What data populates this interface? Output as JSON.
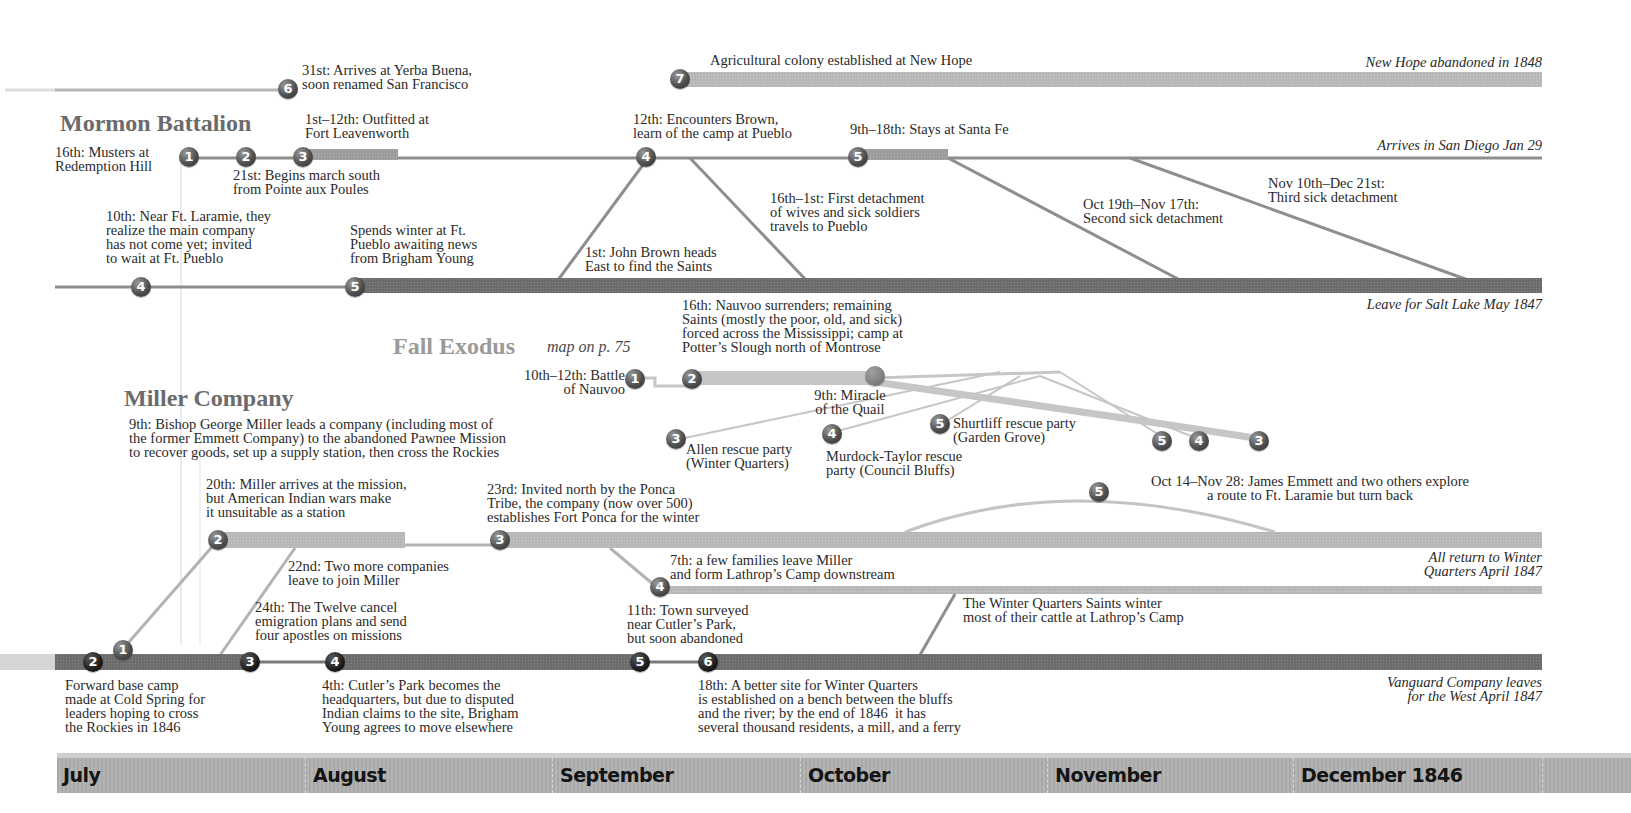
{
  "colors": {
    "battalion_line": "#8a8a8a",
    "battalion_bar": "#9a9a9a",
    "pueblo_bar": "#7c7c7c",
    "new_hope_bar": "#b8b8b8",
    "fall_exodus_line": "#c4c4c4",
    "miller_bar": "#b3b3b3",
    "winter_quarters_bar": "#6e6e6e",
    "month_bar": "#adadad",
    "title_dark": "#6b6b6b",
    "title_light": "#9a9a9a"
  },
  "sections": {
    "mormon_battalion": {
      "title": "Mormon Battalion",
      "events": [
        {
          "n": "1",
          "text": "16th: Musters at\nRedemption Hill"
        },
        {
          "n": "2",
          "text": "21st: Begins march south\nfrom Pointe aux Poules"
        },
        {
          "n": "3",
          "text": "1st–12th: Outfitted at\nFort Leavenworth"
        },
        {
          "n": "4",
          "text": "12th: Encounters Brown,\nlearn of the camp at Pueblo"
        },
        {
          "n": "5",
          "text": "9th–18th: Stays at Santa Fe"
        },
        {
          "n": "6",
          "text": "31st: Arrives at Yerba Buena,\nsoon renamed San Francisco"
        },
        {
          "n": "7",
          "text": "Agricultural colony established at New Hope"
        }
      ],
      "end_labels": {
        "new_hope": "New Hope abandoned in 1848",
        "san_diego": "Arrives in San Diego Jan 29"
      },
      "detachments": [
        {
          "text": "16th–1st: First detachment\nof wives and sick soldiers\ntravels to Pueblo"
        },
        {
          "text": "Oct 19th–Nov 17th:\nSecond sick detachment"
        },
        {
          "text": "Nov 10th–Dec 21st:\nThird sick detachment"
        }
      ]
    },
    "pueblo": {
      "events": [
        {
          "n": "4",
          "text": "10th: Near Ft. Laramie, they\nrealize the main company\nhas not come yet; invited\nto wait at Ft. Pueblo"
        },
        {
          "n": "5",
          "text": "Spends winter at Ft.\nPueblo awaiting news\nfrom Brigham Young"
        }
      ],
      "brown_note": "1st: John Brown heads\nEast to find the Saints",
      "end_label": "Leave for Salt Lake May 1847"
    },
    "fall_exodus": {
      "title": "Fall Exodus",
      "map_ref": "map on p. 75",
      "events": [
        {
          "n": "1",
          "text": "10th–12th: Battle\nof Nauvoo"
        },
        {
          "n": "2",
          "text": "16th: Nauvoo surrenders; remaining\nSaints (mostly the poor, old, and sick)\nforced across the Mississippi; camp at\nPotter’s Slough north of Montrose"
        },
        {
          "n": "3",
          "text": "Allen rescue party\n(Winter Quarters)"
        },
        {
          "n": "4",
          "text": "Murdock-Taylor rescue\nparty (Council Bluffs)"
        },
        {
          "n": "5",
          "text": "Shurtliff rescue party\n(Garden Grove)"
        }
      ],
      "quail_note": "9th: Miracle\nof the Quail",
      "return_markers": [
        "5",
        "4",
        "3"
      ]
    },
    "miller_company": {
      "title": "Miller Company",
      "intro": "9th: Bishop George Miller leads a company (including most of\nthe former Emmett Company) to the abandoned Pawnee Mission\nto recover goods, set up a supply station, then cross the Rockies",
      "events": [
        {
          "n": "1",
          "text": ""
        },
        {
          "n": "2",
          "text": "20th: Miller arrives at the mission,\nbut American Indian wars make\nit unsuitable as a station"
        },
        {
          "n": "3",
          "text": "23rd: Invited north by the Ponca\nTribe, the company (now over 500)\nestablishes Fort Ponca for the winter"
        },
        {
          "n": "4",
          "text": "7th: a few families leave Miller\nand form Lathrop’s Camp downstream"
        },
        {
          "n": "5",
          "text": "Oct 14–Nov 28: James Emmett and two others explore\na route to Ft. Laramie but turn back"
        }
      ],
      "join_note": "22nd: Two more companies\nleave to join Miller",
      "end_label": "All return to Winter\nQuarters April 1847",
      "cattle_note": "The Winter Quarters Saints winter\nmost of their cattle at Lathrop’s Camp"
    },
    "winter_quarters": {
      "events": [
        {
          "n": "2",
          "text": "Forward base camp\nmade at Cold Spring for\nleaders hoping to cross\nthe Rockies in 1846"
        },
        {
          "n": "3",
          "text": "24th: The Twelve cancel\nemigration plans and send\nfour apostles on missions"
        },
        {
          "n": "4",
          "text": "4th: Cutler’s Park becomes the\nheadquarters, but due to disputed\nIndian claims to the site, Brigham\nYoung agrees to move elsewhere"
        },
        {
          "n": "5",
          "text": "11th: Town surveyed\nnear Cutler’s Park,\nbut soon abandoned"
        },
        {
          "n": "6",
          "text": "18th: A better site for Winter Quarters\nis established on a bench between the bluffs\nand the river; by the end of 1846  it has\nseveral thousand residents, a mill, and a ferry"
        }
      ],
      "end_label": "Vanguard Company leaves\nfor the West April 1847"
    }
  },
  "months": [
    "July",
    "August",
    "September",
    "October",
    "November",
    "December 1846"
  ]
}
